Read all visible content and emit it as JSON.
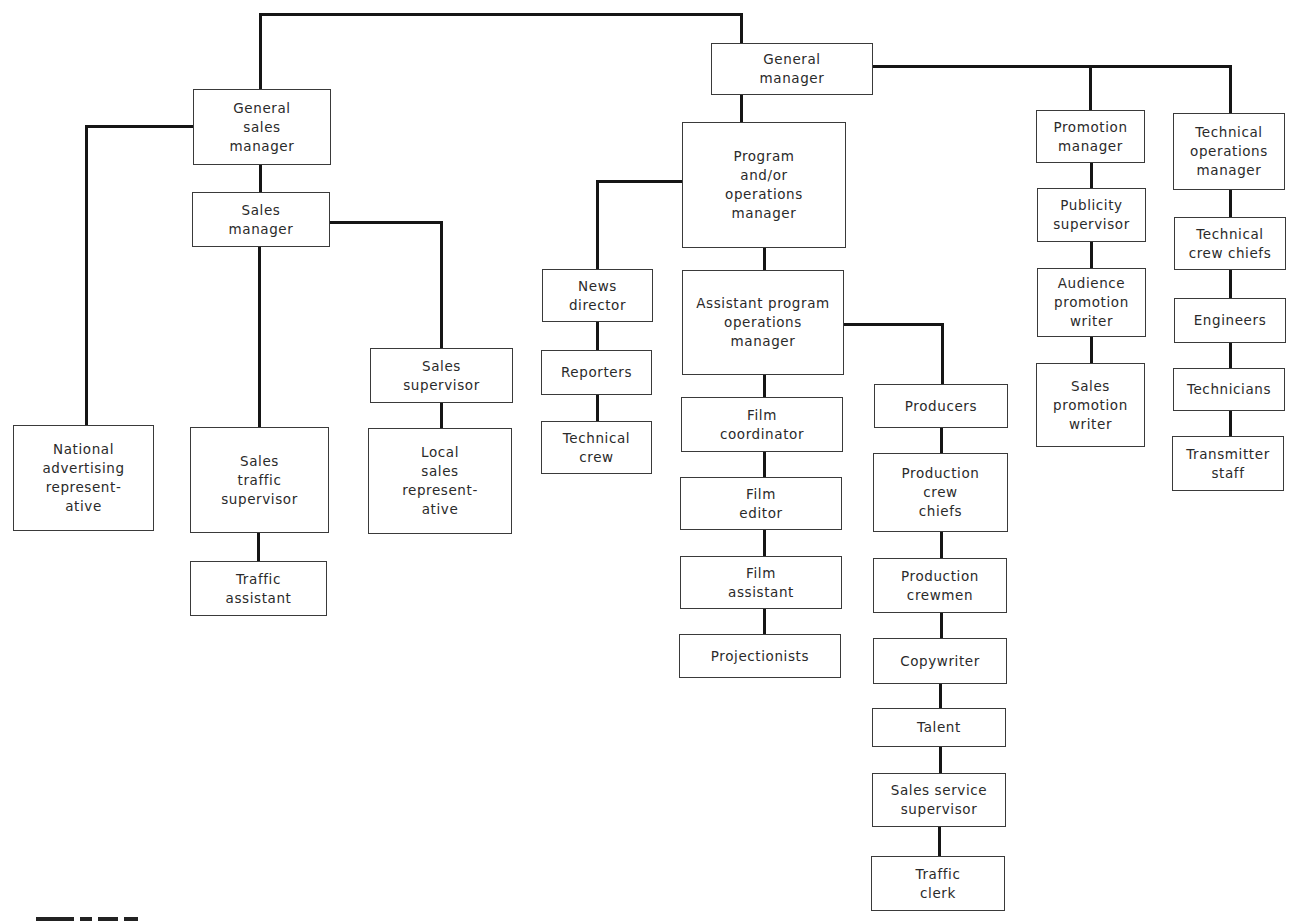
{
  "diagram": {
    "type": "org-chart",
    "line_color": "#151515",
    "box_border_color": "#3a3a3a",
    "text_color": "#2a2a2a",
    "nodes": [
      {
        "id": "general_manager",
        "label": "General\nmanager",
        "x": 711,
        "y": 43,
        "w": 162,
        "h": 52
      },
      {
        "id": "general_sales_manager",
        "label": "General\nsales\nmanager",
        "x": 193,
        "y": 89,
        "w": 138,
        "h": 76
      },
      {
        "id": "sales_manager",
        "label": "Sales\nmanager",
        "x": 192,
        "y": 192,
        "w": 138,
        "h": 55
      },
      {
        "id": "national_advertising_rep",
        "label": "National\nadvertising\nrepresent-\native",
        "x": 13,
        "y": 425,
        "w": 141,
        "h": 106
      },
      {
        "id": "sales_traffic_supervisor",
        "label": "Sales\ntraffic\nsupervisor",
        "x": 190,
        "y": 427,
        "w": 139,
        "h": 106
      },
      {
        "id": "traffic_assistant",
        "label": "Traffic\nassistant",
        "x": 190,
        "y": 561,
        "w": 137,
        "h": 55
      },
      {
        "id": "sales_supervisor",
        "label": "Sales\nsupervisor",
        "x": 370,
        "y": 348,
        "w": 143,
        "h": 55
      },
      {
        "id": "local_sales_rep",
        "label": "Local\nsales\nrepresent-\native",
        "x": 368,
        "y": 428,
        "w": 144,
        "h": 106
      },
      {
        "id": "program_operations_manager",
        "label": "Program\nand/or\noperations\nmanager",
        "x": 682,
        "y": 122,
        "w": 164,
        "h": 126
      },
      {
        "id": "news_director",
        "label": "News\ndirector",
        "x": 542,
        "y": 269,
        "w": 111,
        "h": 53
      },
      {
        "id": "reporters",
        "label": "Reporters",
        "x": 541,
        "y": 350,
        "w": 111,
        "h": 45
      },
      {
        "id": "technical_crew",
        "label": "Technical\ncrew",
        "x": 541,
        "y": 421,
        "w": 111,
        "h": 53
      },
      {
        "id": "assistant_program_operations_manager",
        "label": "Assistant program\noperations\nmanager",
        "x": 682,
        "y": 270,
        "w": 162,
        "h": 105
      },
      {
        "id": "film_coordinator",
        "label": "Film\ncoordinator",
        "x": 681,
        "y": 397,
        "w": 162,
        "h": 55
      },
      {
        "id": "film_editor",
        "label": "Film\neditor",
        "x": 680,
        "y": 477,
        "w": 162,
        "h": 53
      },
      {
        "id": "film_assistant",
        "label": "Film\nassistant",
        "x": 680,
        "y": 556,
        "w": 162,
        "h": 53
      },
      {
        "id": "projectionists",
        "label": "Projectionists",
        "x": 679,
        "y": 634,
        "w": 162,
        "h": 44
      },
      {
        "id": "producers",
        "label": "Producers",
        "x": 874,
        "y": 384,
        "w": 134,
        "h": 44
      },
      {
        "id": "production_crew_chiefs",
        "label": "Production\ncrew\nchiefs",
        "x": 873,
        "y": 453,
        "w": 135,
        "h": 79
      },
      {
        "id": "production_crewmen",
        "label": "Production\ncrewmen",
        "x": 873,
        "y": 558,
        "w": 134,
        "h": 55
      },
      {
        "id": "copywriter",
        "label": "Copywriter",
        "x": 873,
        "y": 638,
        "w": 134,
        "h": 46
      },
      {
        "id": "talent",
        "label": "Talent",
        "x": 872,
        "y": 708,
        "w": 134,
        "h": 39
      },
      {
        "id": "sales_service_supervisor",
        "label": "Sales service\nsupervisor",
        "x": 872,
        "y": 773,
        "w": 134,
        "h": 54
      },
      {
        "id": "traffic_clerk",
        "label": "Traffic\nclerk",
        "x": 871,
        "y": 856,
        "w": 134,
        "h": 55
      },
      {
        "id": "promotion_manager",
        "label": "Promotion\nmanager",
        "x": 1036,
        "y": 110,
        "w": 109,
        "h": 53
      },
      {
        "id": "publicity_supervisor",
        "label": "Publicity\nsupervisor",
        "x": 1037,
        "y": 188,
        "w": 109,
        "h": 54
      },
      {
        "id": "audience_promotion_writer",
        "label": "Audience\npromotion\nwriter",
        "x": 1037,
        "y": 268,
        "w": 109,
        "h": 69
      },
      {
        "id": "sales_promotion_writer",
        "label": "Sales\npromotion\nwriter",
        "x": 1036,
        "y": 363,
        "w": 109,
        "h": 84
      },
      {
        "id": "technical_operations_manager",
        "label": "Technical\noperations\nmanager",
        "x": 1173,
        "y": 113,
        "w": 112,
        "h": 77
      },
      {
        "id": "technical_crew_chiefs",
        "label": "Technical\ncrew chiefs",
        "x": 1174,
        "y": 217,
        "w": 112,
        "h": 53
      },
      {
        "id": "engineers",
        "label": "Engineers",
        "x": 1174,
        "y": 298,
        "w": 112,
        "h": 45
      },
      {
        "id": "technicians",
        "label": "Technicians",
        "x": 1173,
        "y": 368,
        "w": 112,
        "h": 43
      },
      {
        "id": "transmitter_staff",
        "label": "Transmitter\nstaff",
        "x": 1172,
        "y": 436,
        "w": 112,
        "h": 55
      }
    ],
    "edges": [
      [
        "general_manager",
        "general_sales_manager"
      ],
      [
        "general_manager",
        "program_operations_manager"
      ],
      [
        "general_manager",
        "promotion_manager"
      ],
      [
        "general_manager",
        "technical_operations_manager"
      ],
      [
        "general_sales_manager",
        "national_advertising_rep"
      ],
      [
        "general_sales_manager",
        "sales_manager"
      ],
      [
        "sales_manager",
        "sales_traffic_supervisor"
      ],
      [
        "sales_manager",
        "sales_supervisor"
      ],
      [
        "sales_traffic_supervisor",
        "traffic_assistant"
      ],
      [
        "sales_supervisor",
        "local_sales_rep"
      ],
      [
        "program_operations_manager",
        "news_director"
      ],
      [
        "program_operations_manager",
        "assistant_program_operations_manager"
      ],
      [
        "news_director",
        "reporters"
      ],
      [
        "reporters",
        "technical_crew"
      ],
      [
        "assistant_program_operations_manager",
        "film_coordinator"
      ],
      [
        "assistant_program_operations_manager",
        "producers"
      ],
      [
        "film_coordinator",
        "film_editor"
      ],
      [
        "film_editor",
        "film_assistant"
      ],
      [
        "film_assistant",
        "projectionists"
      ],
      [
        "producers",
        "production_crew_chiefs"
      ],
      [
        "production_crew_chiefs",
        "production_crewmen"
      ],
      [
        "production_crewmen",
        "copywriter"
      ],
      [
        "copywriter",
        "talent"
      ],
      [
        "talent",
        "sales_service_supervisor"
      ],
      [
        "sales_service_supervisor",
        "traffic_clerk"
      ],
      [
        "promotion_manager",
        "publicity_supervisor"
      ],
      [
        "publicity_supervisor",
        "audience_promotion_writer"
      ],
      [
        "audience_promotion_writer",
        "sales_promotion_writer"
      ],
      [
        "technical_operations_manager",
        "technical_crew_chiefs"
      ],
      [
        "technical_crew_chiefs",
        "engineers"
      ],
      [
        "engineers",
        "technicians"
      ],
      [
        "technicians",
        "transmitter_staff"
      ]
    ],
    "wires": [
      [
        260,
        14,
        741,
        14
      ],
      [
        260,
        14,
        260,
        89
      ],
      [
        741,
        14,
        741,
        43
      ],
      [
        741,
        95,
        741,
        122
      ],
      [
        873,
        66,
        1230,
        66
      ],
      [
        1090,
        66,
        1090,
        110
      ],
      [
        1230,
        66,
        1230,
        113
      ],
      [
        86,
        126,
        193,
        126
      ],
      [
        86,
        126,
        86,
        425
      ],
      [
        260,
        165,
        260,
        192
      ],
      [
        330,
        222,
        441,
        222
      ],
      [
        441,
        222,
        441,
        348
      ],
      [
        259,
        247,
        259,
        427
      ],
      [
        258,
        533,
        258,
        561
      ],
      [
        441,
        403,
        441,
        428
      ],
      [
        597,
        181,
        682,
        181
      ],
      [
        597,
        181,
        597,
        269
      ],
      [
        764,
        248,
        764,
        270
      ],
      [
        597,
        322,
        597,
        350
      ],
      [
        597,
        395,
        597,
        421
      ],
      [
        844,
        324,
        942,
        324
      ],
      [
        942,
        324,
        942,
        384
      ],
      [
        764,
        375,
        764,
        397
      ],
      [
        764,
        452,
        764,
        477
      ],
      [
        764,
        530,
        764,
        556
      ],
      [
        764,
        609,
        764,
        634
      ],
      [
        941,
        428,
        941,
        453
      ],
      [
        941,
        532,
        941,
        558
      ],
      [
        941,
        613,
        941,
        638
      ],
      [
        940,
        684,
        940,
        708
      ],
      [
        940,
        747,
        940,
        773
      ],
      [
        939,
        827,
        939,
        856
      ],
      [
        1091,
        163,
        1091,
        188
      ],
      [
        1091,
        242,
        1091,
        268
      ],
      [
        1091,
        337,
        1091,
        363
      ],
      [
        1230,
        190,
        1230,
        217
      ],
      [
        1230,
        270,
        1230,
        298
      ],
      [
        1230,
        343,
        1230,
        368
      ],
      [
        1230,
        411,
        1230,
        436
      ]
    ]
  },
  "caption": {
    "visible_text": "",
    "note": "partially cropped text fragment at bottom-left edge"
  }
}
